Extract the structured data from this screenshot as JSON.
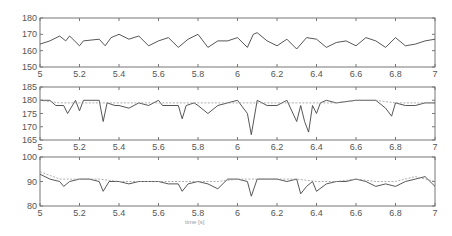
{
  "chart_data": [
    {
      "type": "line",
      "title": "",
      "xlabel": "",
      "ylabel": "",
      "xlim": [
        5,
        7
      ],
      "ylim": [
        150,
        180
      ],
      "xticks": [
        "5",
        "5.2",
        "5.4",
        "5.6",
        "5.8",
        "6",
        "6.2",
        "6.4",
        "6.6",
        "6.8",
        "7"
      ],
      "yticks": [
        "150",
        "160",
        "170",
        "180"
      ],
      "grid": false,
      "series": [
        {
          "name": "signal",
          "style": "solid",
          "x": [
            5.0,
            5.05,
            5.1,
            5.13,
            5.15,
            5.2,
            5.22,
            5.3,
            5.33,
            5.36,
            5.4,
            5.45,
            5.5,
            5.55,
            5.6,
            5.65,
            5.7,
            5.75,
            5.8,
            5.85,
            5.9,
            5.95,
            6.0,
            6.05,
            6.08,
            6.1,
            6.15,
            6.2,
            6.25,
            6.3,
            6.35,
            6.4,
            6.45,
            6.5,
            6.55,
            6.6,
            6.65,
            6.7,
            6.75,
            6.8,
            6.85,
            6.9,
            6.95,
            7.0
          ],
          "y": [
            164,
            166,
            169,
            166,
            169,
            163,
            166,
            167,
            163,
            168,
            170,
            167,
            169,
            163,
            166,
            168,
            162,
            167,
            170,
            162,
            166,
            166,
            168,
            162,
            170,
            171,
            166,
            163,
            167,
            161,
            168,
            167,
            162,
            165,
            166,
            163,
            168,
            166,
            162,
            168,
            163,
            164,
            166,
            167
          ]
        }
      ]
    },
    {
      "type": "line",
      "xlim": [
        5,
        7
      ],
      "ylim": [
        165,
        185
      ],
      "xticks": [
        "5",
        "5.2",
        "5.4",
        "5.6",
        "5.8",
        "6",
        "6.2",
        "6.4",
        "6.6",
        "6.8",
        "7"
      ],
      "yticks": [
        "165",
        "170",
        "175",
        "180",
        "185"
      ],
      "grid": false,
      "series": [
        {
          "name": "measured",
          "style": "solid",
          "x": [
            5.0,
            5.05,
            5.08,
            5.12,
            5.14,
            5.18,
            5.2,
            5.22,
            5.3,
            5.32,
            5.34,
            5.38,
            5.4,
            5.45,
            5.5,
            5.55,
            5.6,
            5.62,
            5.7,
            5.72,
            5.74,
            5.78,
            5.8,
            5.85,
            5.9,
            5.95,
            6.0,
            6.05,
            6.07,
            6.1,
            6.15,
            6.2,
            6.25,
            6.3,
            6.32,
            6.34,
            6.36,
            6.38,
            6.4,
            6.42,
            6.45,
            6.5,
            6.6,
            6.65,
            6.7,
            6.75,
            6.78,
            6.8,
            6.85,
            6.9,
            6.95,
            7.0
          ],
          "y": [
            180,
            180,
            178,
            178,
            175,
            180,
            176,
            180,
            180,
            172,
            179,
            178,
            178,
            177,
            179,
            178,
            180,
            178,
            178,
            173,
            178,
            179,
            178,
            175,
            178,
            179,
            180,
            175,
            167,
            180,
            178,
            178,
            180,
            172,
            178,
            172,
            168,
            178,
            175,
            179,
            180,
            179,
            180,
            180,
            180,
            177,
            174,
            179,
            178,
            178,
            179,
            179
          ]
        },
        {
          "name": "estimated",
          "style": "dashed",
          "x": [
            5.0,
            5.1,
            5.2,
            5.3,
            5.4,
            5.5,
            5.6,
            5.7,
            5.8,
            5.9,
            6.0,
            6.1,
            6.2,
            6.3,
            6.4,
            6.5,
            6.6,
            6.7,
            6.8,
            6.9,
            7.0
          ],
          "y": [
            180,
            179,
            179,
            179,
            179,
            179,
            179,
            179,
            179,
            179,
            179,
            179,
            179,
            179,
            179,
            179,
            180,
            180,
            179,
            179,
            179
          ]
        }
      ]
    },
    {
      "type": "line",
      "xlim": [
        5,
        7
      ],
      "ylim": [
        80,
        100
      ],
      "xticks": [
        "5",
        "5.2",
        "5.4",
        "5.6",
        "5.8",
        "6",
        "6.2",
        "6.4",
        "6.6",
        "6.8",
        "7"
      ],
      "yticks": [
        "80",
        "90",
        "100"
      ],
      "xlabel": "time [s]",
      "grid": false,
      "series": [
        {
          "name": "measured",
          "style": "solid",
          "x": [
            5.0,
            5.05,
            5.1,
            5.12,
            5.15,
            5.2,
            5.25,
            5.3,
            5.32,
            5.35,
            5.4,
            5.45,
            5.5,
            5.55,
            5.6,
            5.65,
            5.7,
            5.72,
            5.75,
            5.8,
            5.85,
            5.9,
            5.95,
            6.0,
            6.05,
            6.07,
            6.1,
            6.15,
            6.2,
            6.25,
            6.3,
            6.32,
            6.35,
            6.38,
            6.4,
            6.45,
            6.5,
            6.55,
            6.6,
            6.65,
            6.7,
            6.75,
            6.8,
            6.85,
            6.9,
            6.95,
            7.0
          ],
          "y": [
            93,
            91,
            90,
            88,
            90,
            91,
            91,
            90,
            86,
            90,
            90,
            89,
            90,
            90,
            90,
            89,
            89,
            86,
            89,
            90,
            89,
            87,
            91,
            91,
            90,
            84,
            91,
            91,
            91,
            90,
            91,
            85,
            88,
            90,
            86,
            89,
            90,
            90,
            91,
            90,
            88,
            89,
            88,
            90,
            91,
            92,
            88
          ]
        },
        {
          "name": "estimated",
          "style": "dashed",
          "x": [
            5.0,
            5.1,
            5.2,
            5.3,
            5.4,
            5.5,
            5.6,
            5.7,
            5.8,
            5.9,
            6.0,
            6.1,
            6.2,
            6.3,
            6.4,
            6.5,
            6.6,
            6.7,
            6.8,
            6.9,
            7.0
          ],
          "y": [
            94,
            91,
            91,
            91,
            90,
            90,
            90,
            90,
            90,
            90,
            91,
            91,
            91,
            91,
            90,
            90,
            91,
            90,
            90,
            92,
            90
          ]
        }
      ]
    }
  ],
  "labels": {
    "x_axis_label": "time [s]"
  }
}
